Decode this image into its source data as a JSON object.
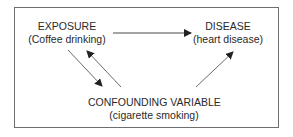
{
  "diagram": {
    "nodes": {
      "exposure": {
        "title": "EXPOSURE",
        "subtitle": "(Coffee drinking)"
      },
      "disease": {
        "title": "DISEASE",
        "subtitle": "(heart disease)"
      },
      "confounder": {
        "title": "CONFOUNDING VARIABLE",
        "subtitle": "(cigarette smoking)"
      }
    },
    "edges": [
      {
        "from": "exposure",
        "to": "disease"
      },
      {
        "from": "exposure",
        "to": "confounder"
      },
      {
        "from": "confounder",
        "to": "exposure"
      },
      {
        "from": "confounder",
        "to": "disease"
      }
    ],
    "colors": {
      "line": "#333333",
      "border": "#6e6e6e"
    }
  }
}
